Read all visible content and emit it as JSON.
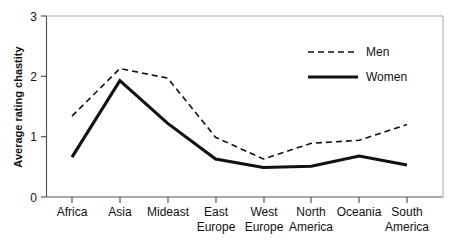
{
  "chart_data": {
    "type": "line",
    "title": "",
    "xlabel": "",
    "ylabel": "Average rating chastity",
    "ylim": [
      0,
      3
    ],
    "yticks": [
      "0",
      "1",
      "2",
      "3"
    ],
    "grid": false,
    "legend_position": "top-right",
    "categories": [
      "Africa",
      "Asia",
      "Mideast",
      "East\nEurope",
      "West\nEurope",
      "North\nAmerica",
      "Oceania",
      "South\nAmerica"
    ],
    "category_lines": [
      [
        "Africa",
        ""
      ],
      [
        "Asia",
        ""
      ],
      [
        "Mideast",
        ""
      ],
      [
        "East",
        "Europe"
      ],
      [
        "West",
        "Europe"
      ],
      [
        "North",
        "America"
      ],
      [
        "Oceania",
        ""
      ],
      [
        "South",
        "America"
      ]
    ],
    "series": [
      {
        "name": "Men",
        "style": "dashed",
        "color": "#111111",
        "values": [
          1.34,
          2.13,
          1.97,
          0.99,
          0.63,
          0.89,
          0.94,
          1.2
        ]
      },
      {
        "name": "Women",
        "style": "solid",
        "color": "#111111",
        "values": [
          0.66,
          1.93,
          1.22,
          0.63,
          0.49,
          0.51,
          0.68,
          0.53
        ]
      }
    ]
  },
  "axis": {
    "y_label": "Average rating chastity",
    "y_ticks": [
      "3",
      "2",
      "1",
      "0"
    ]
  },
  "legend": {
    "items": [
      {
        "label": "Men",
        "style": "dashed"
      },
      {
        "label": "Women",
        "style": "solid"
      }
    ]
  }
}
